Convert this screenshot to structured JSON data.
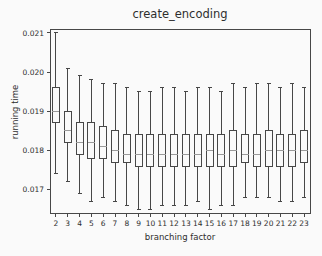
{
  "chart_data": {
    "type": "boxplot",
    "title": "create_encoding",
    "xlabel": "branching factor",
    "ylabel": "running time",
    "categories": [
      "2",
      "3",
      "4",
      "5",
      "6",
      "7",
      "8",
      "9",
      "10",
      "11",
      "12",
      "13",
      "14",
      "15",
      "16",
      "17",
      "18",
      "19",
      "20",
      "21",
      "22",
      "23"
    ],
    "y_tick_values": [
      0.017,
      0.018,
      0.019,
      0.02,
      0.021
    ],
    "y_tick_labels": [
      "0.017",
      "0.018",
      "0.019",
      "0.020",
      "0.021"
    ],
    "ylim": [
      0.0164,
      0.0211
    ],
    "grid": false,
    "legend": "none",
    "boxes": [
      {
        "category": "2",
        "low": 0.0174,
        "q1": 0.0187,
        "median": 0.019,
        "q3": 0.0196,
        "high": 0.021
      },
      {
        "category": "3",
        "low": 0.0172,
        "q1": 0.0182,
        "median": 0.0185,
        "q3": 0.019,
        "high": 0.0201
      },
      {
        "category": "4",
        "low": 0.0169,
        "q1": 0.0179,
        "median": 0.0182,
        "q3": 0.0187,
        "high": 0.0199
      },
      {
        "category": "5",
        "low": 0.0167,
        "q1": 0.0178,
        "median": 0.0182,
        "q3": 0.0187,
        "high": 0.0198
      },
      {
        "category": "6",
        "low": 0.0168,
        "q1": 0.0178,
        "median": 0.0181,
        "q3": 0.0186,
        "high": 0.0197
      },
      {
        "category": "7",
        "low": 0.0167,
        "q1": 0.0177,
        "median": 0.018,
        "q3": 0.0185,
        "high": 0.0197
      },
      {
        "category": "8",
        "low": 0.0166,
        "q1": 0.0177,
        "median": 0.0179,
        "q3": 0.0184,
        "high": 0.0196
      },
      {
        "category": "9",
        "low": 0.0165,
        "q1": 0.0176,
        "median": 0.0179,
        "q3": 0.0184,
        "high": 0.0195
      },
      {
        "category": "10",
        "low": 0.0165,
        "q1": 0.0176,
        "median": 0.0179,
        "q3": 0.0184,
        "high": 0.0195
      },
      {
        "category": "11",
        "low": 0.0166,
        "q1": 0.0176,
        "median": 0.0179,
        "q3": 0.0184,
        "high": 0.0196
      },
      {
        "category": "12",
        "low": 0.0166,
        "q1": 0.0176,
        "median": 0.0179,
        "q3": 0.0184,
        "high": 0.0196
      },
      {
        "category": "13",
        "low": 0.0166,
        "q1": 0.0176,
        "median": 0.0179,
        "q3": 0.0184,
        "high": 0.0195
      },
      {
        "category": "14",
        "low": 0.0167,
        "q1": 0.0176,
        "median": 0.0179,
        "q3": 0.0184,
        "high": 0.0196
      },
      {
        "category": "15",
        "low": 0.0165,
        "q1": 0.0176,
        "median": 0.018,
        "q3": 0.0184,
        "high": 0.0196
      },
      {
        "category": "16",
        "low": 0.0166,
        "q1": 0.0176,
        "median": 0.0179,
        "q3": 0.0184,
        "high": 0.0195
      },
      {
        "category": "17",
        "low": 0.0166,
        "q1": 0.0176,
        "median": 0.018,
        "q3": 0.0185,
        "high": 0.0197
      },
      {
        "category": "18",
        "low": 0.0168,
        "q1": 0.0177,
        "median": 0.0179,
        "q3": 0.0184,
        "high": 0.0196
      },
      {
        "category": "19",
        "low": 0.0168,
        "q1": 0.0176,
        "median": 0.0179,
        "q3": 0.0184,
        "high": 0.0197
      },
      {
        "category": "20",
        "low": 0.0168,
        "q1": 0.0176,
        "median": 0.018,
        "q3": 0.0185,
        "high": 0.0197
      },
      {
        "category": "21",
        "low": 0.0167,
        "q1": 0.0176,
        "median": 0.018,
        "q3": 0.0184,
        "high": 0.0196
      },
      {
        "category": "22",
        "low": 0.0167,
        "q1": 0.0176,
        "median": 0.018,
        "q3": 0.0184,
        "high": 0.0197
      },
      {
        "category": "23",
        "low": 0.0168,
        "q1": 0.0177,
        "median": 0.018,
        "q3": 0.0185,
        "high": 0.0196
      }
    ]
  },
  "colors": {
    "background": "#fafafa",
    "box_line": "#474747",
    "median_line": "#9a9a9a",
    "axis_line": "#474747",
    "text": "#2e2e2e"
  }
}
